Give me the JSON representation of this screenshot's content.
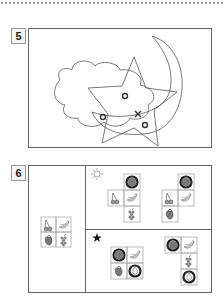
{
  "questions": [
    {
      "number": "5",
      "description": "Overlapping outline shapes: cloud, star and crescent moon with marks"
    },
    {
      "number": "6",
      "description": "Fruit grid puzzle with sun and star conditions"
    }
  ],
  "q5": {
    "shapes": [
      "cloud",
      "star",
      "crescent-moon"
    ],
    "marks": [
      {
        "type": "circle",
        "x": 125,
        "y": 96
      },
      {
        "type": "circle",
        "x": 103,
        "y": 117
      },
      {
        "type": "cross",
        "x": 138,
        "y": 114
      },
      {
        "type": "circle",
        "x": 145,
        "y": 125
      }
    ]
  },
  "q6": {
    "reference_grid": [
      "cherry",
      "banana",
      "strawberry",
      "grapes"
    ],
    "sun_row_symbol": "☼",
    "star_row_symbol": "★",
    "colors": {
      "frame": "#666666",
      "cell_border": "#aaaaaa",
      "mark": "#333333"
    }
  }
}
